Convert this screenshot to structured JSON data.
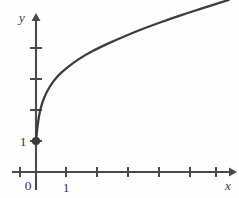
{
  "chart_data": {
    "type": "line",
    "title": "",
    "subtitle": "",
    "xlabel": "x",
    "ylabel": "y",
    "xlim": [
      -0.55,
      6.45
    ],
    "ylim": [
      -0.95,
      6.3
    ],
    "grid": false,
    "legend": null,
    "x_ticks": [
      -0.5,
      0,
      1,
      2,
      3,
      4,
      5,
      6
    ],
    "x_tick_labels": [
      "",
      "0",
      "1",
      "",
      "",
      "",
      "",
      ""
    ],
    "y_ticks": [
      1,
      2,
      3,
      4
    ],
    "y_tick_labels": [
      "1",
      "",
      "",
      ""
    ],
    "axis_origin_label": "0",
    "annotations": [
      {
        "name": "endpoint-dot",
        "x": 0,
        "y": 1,
        "style": "filled-circle"
      }
    ],
    "series": [
      {
        "name": "curve",
        "domain_start": 0,
        "domain_end": 6.3,
        "points": [
          {
            "x": 0.0,
            "y": 1.0
          },
          {
            "x": 0.06,
            "y": 1.55
          },
          {
            "x": 0.14,
            "y": 2.0
          },
          {
            "x": 0.26,
            "y": 2.38
          },
          {
            "x": 0.45,
            "y": 2.75
          },
          {
            "x": 0.7,
            "y": 3.08
          },
          {
            "x": 1.0,
            "y": 3.35
          },
          {
            "x": 1.4,
            "y": 3.64
          },
          {
            "x": 1.85,
            "y": 3.9
          },
          {
            "x": 2.35,
            "y": 4.14
          },
          {
            "x": 2.9,
            "y": 4.38
          },
          {
            "x": 3.5,
            "y": 4.62
          },
          {
            "x": 4.1,
            "y": 4.84
          },
          {
            "x": 4.75,
            "y": 5.06
          },
          {
            "x": 5.4,
            "y": 5.27
          },
          {
            "x": 6.3,
            "y": 5.55
          }
        ]
      }
    ]
  },
  "labels": {
    "y_axis": "y",
    "x_axis": "x",
    "origin": "0",
    "x_one": "1",
    "y_one": "1"
  },
  "colors": {
    "axis": "#4a4a4a",
    "curve": "#3d3d3d",
    "text": "#3a3a3a",
    "background": "#fefefe"
  }
}
